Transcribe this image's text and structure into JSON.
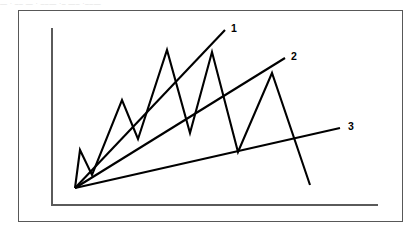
{
  "page": {
    "top_strip_text": "—  ·  –– —  · ––— ·– —– ·––—"
  },
  "chart_data": {
    "type": "line",
    "title": "",
    "subtitle": "",
    "xlabel": "",
    "ylabel": "",
    "grid": false,
    "legend": "none",
    "axes": {
      "origin_px": [
        52,
        205
      ],
      "y_axis_top_px": [
        52,
        28
      ],
      "x_axis_right_px": [
        378,
        205
      ],
      "xlim": [
        0,
        100
      ],
      "ylim": [
        0,
        100
      ]
    },
    "series": [
      {
        "name": "price",
        "type": "zigzag-line",
        "points_px": [
          [
            75,
            188
          ],
          [
            80,
            150
          ],
          [
            92,
            175
          ],
          [
            122,
            100
          ],
          [
            138,
            139
          ],
          [
            167,
            50
          ],
          [
            190,
            133
          ],
          [
            212,
            52
          ],
          [
            238,
            152
          ],
          [
            272,
            73
          ],
          [
            310,
            185
          ]
        ],
        "values": [
          4,
          28,
          12,
          52,
          26,
          76,
          30,
          75,
          20,
          66,
          8
        ]
      }
    ],
    "fan_lines": [
      {
        "label": "1",
        "from_px": [
          75,
          188
        ],
        "to_px": [
          225,
          30
        ],
        "label_px": [
          231,
          32
        ],
        "slope_desc": "steepest fan line"
      },
      {
        "label": "2",
        "from_px": [
          75,
          188
        ],
        "to_px": [
          285,
          58
        ],
        "label_px": [
          291,
          60
        ],
        "slope_desc": "middle fan line"
      },
      {
        "label": "3",
        "from_px": [
          75,
          188
        ],
        "to_px": [
          340,
          128
        ],
        "label_px": [
          348,
          130
        ],
        "slope_desc": "shallowest fan line"
      }
    ],
    "annotations": [
      {
        "text": "1",
        "x_px": 231,
        "y_px": 32
      },
      {
        "text": "2",
        "x_px": 291,
        "y_px": 60
      },
      {
        "text": "3",
        "x_px": 348,
        "y_px": 130
      }
    ],
    "colors": {
      "series_stroke": "#000000",
      "fan_stroke": "#000000",
      "axis_stroke": "#5a5a5a",
      "frame_border": "#585858",
      "background": "#ffffff"
    }
  }
}
